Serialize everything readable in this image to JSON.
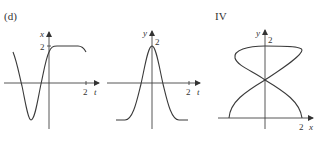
{
  "figure": {
    "panels": [
      {
        "id": "d",
        "label": "(d)",
        "vertical_axis_label": "x",
        "horizontal_axis_label": "t",
        "vertical_tick_label": "2",
        "horizontal_tick_label": "2",
        "description": "x as a function of t"
      },
      {
        "id": "d-y",
        "label": "",
        "vertical_axis_label": "y",
        "horizontal_axis_label": "t",
        "vertical_tick_label": "2",
        "horizontal_tick_label": "2",
        "description": "y as a function of t"
      },
      {
        "id": "IV",
        "label": "IV",
        "vertical_axis_label": "y",
        "horizontal_axis_label": "x",
        "vertical_tick_label": "2",
        "horizontal_tick_label": "2",
        "description": "parametric curve y vs x"
      }
    ]
  },
  "colors": {
    "background": "#ffffff",
    "ink": "#3a3a3a"
  }
}
